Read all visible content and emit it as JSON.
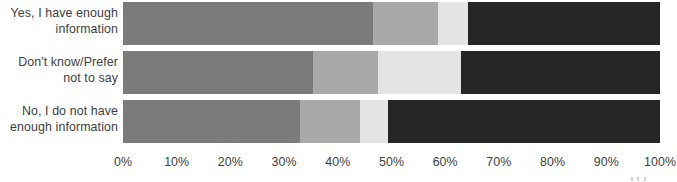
{
  "chart_data": {
    "type": "bar",
    "title": "",
    "subtitle": "",
    "orientation": "horizontal",
    "stacked": true,
    "stack_mode": "percent",
    "xlabel": "",
    "ylabel": "",
    "xlim": [
      0,
      100
    ],
    "grid": false,
    "legend_position": "none",
    "xticks": [
      "0%",
      "10%",
      "20%",
      "30%",
      "40%",
      "50%",
      "60%",
      "70%",
      "80%",
      "90%",
      "100%"
    ],
    "xtick_values": [
      0,
      10,
      20,
      30,
      40,
      50,
      60,
      70,
      80,
      90,
      100
    ],
    "categories": [
      "Yes, I have enough information",
      "Don't know/Prefer not to say",
      "No, I do not have enough information"
    ],
    "category_lines": [
      [
        "Yes, I have enough",
        "information"
      ],
      [
        "Don't know/Prefer",
        "not to say"
      ],
      [
        "No, I do not have",
        "enough information"
      ]
    ],
    "series": [
      {
        "name": "Segment 1",
        "color": "#7b7b7b",
        "values": [
          46.6,
          35.4,
          33.0
        ]
      },
      {
        "name": "Segment 2",
        "color": "#a9a9a9",
        "values": [
          12.1,
          12.1,
          11.1
        ]
      },
      {
        "name": "Segment 3",
        "color": "#e4e4e4",
        "values": [
          5.5,
          15.5,
          5.2
        ]
      },
      {
        "name": "Segment 4",
        "color": "#262626",
        "values": [
          35.8,
          37.0,
          50.7
        ]
      }
    ]
  },
  "colors": {
    "segment_1": "#7b7b7b",
    "segment_2": "#a9a9a9",
    "segment_3": "#e4e4e4",
    "segment_4": "#262626",
    "text": "#3d3d3d",
    "background": "#ffffff"
  }
}
